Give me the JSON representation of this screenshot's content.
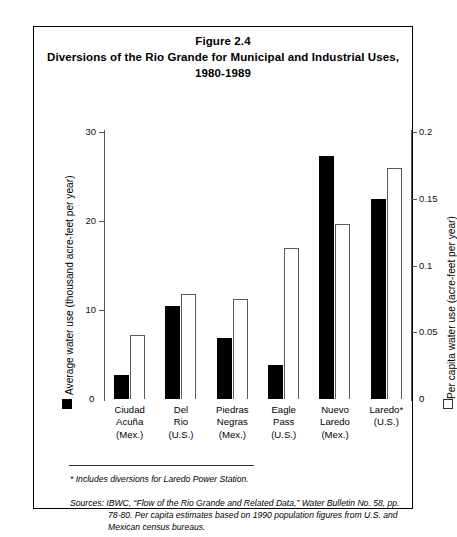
{
  "figure": {
    "title_line1": "Figure 2.4",
    "title_line2": "Diversions of the Rio Grande for Municipal and Industrial Uses,",
    "title_line3": "1980-1989"
  },
  "axes": {
    "left_title": "Average water use (thousand acre-feet per year)",
    "right_title": "Per capita water use (acre-feet per year)",
    "left_ticks": [
      "30",
      "20",
      "10",
      "0"
    ],
    "right_ticks": [
      "0.2",
      "0.15",
      "0.1",
      "0.05",
      "0"
    ],
    "zero_left": "0",
    "zero_right": "0"
  },
  "legend": {
    "black_swatch": "average-water-use",
    "white_swatch": "per-capita-water-use"
  },
  "notes": {
    "footnote": "* Includes diversions for Laredo Power Station.",
    "sources_label": "Sources:",
    "sources_line1": "IBWC, “Flow of the Rio Grande and Related Data,” Water Bulletin No. 58, pp.",
    "sources_line2": "78-80. Per capita estimates based on 1990 population figures from U.S. and",
    "sources_line3": "Mexican census bureaus."
  },
  "chart_data": {
    "type": "bar",
    "title": "Diversions of the Rio Grande for Municipal and Industrial Uses, 1980-1989",
    "xlabel": "",
    "categories": [
      "Ciudad Acuña (Mex.)",
      "Del Rio (U.S.)",
      "Piedras Negras (Mex.)",
      "Eagle Pass (U.S.)",
      "Nuevo Laredo (Mex.)",
      "Laredo* (U.S.)"
    ],
    "category_lines": [
      [
        "Ciudad",
        "Acuña",
        "(Mex.)"
      ],
      [
        "Del",
        "Rio",
        "(U.S.)"
      ],
      [
        "Piedras",
        "Negras",
        "(Mex.)"
      ],
      [
        "Eagle",
        "Pass",
        "(U.S.)"
      ],
      [
        "Nuevo",
        "Laredo",
        "(Mex.)"
      ],
      [
        "Laredo*",
        "(U.S.)",
        ""
      ]
    ],
    "series": [
      {
        "name": "Average water use (thousand acre-feet per year)",
        "axis": "left",
        "style": "filled-black",
        "color": "#000000",
        "values": [
          2.7,
          10.4,
          6.8,
          3.8,
          27.3,
          22.5
        ]
      },
      {
        "name": "Per capita water use (acre-feet per year)",
        "axis": "right",
        "style": "open-outline",
        "color": "#ffffff",
        "values": [
          0.048,
          0.079,
          0.075,
          0.113,
          0.131,
          0.173
        ]
      }
    ],
    "ylabel": "Average water use (thousand acre-feet per year)",
    "ylim": [
      0,
      30
    ],
    "y2label": "Per capita water use (acre-feet per year)",
    "y2lim": [
      0,
      0.2
    ],
    "grid": false,
    "legend_position": "axis-labels"
  }
}
